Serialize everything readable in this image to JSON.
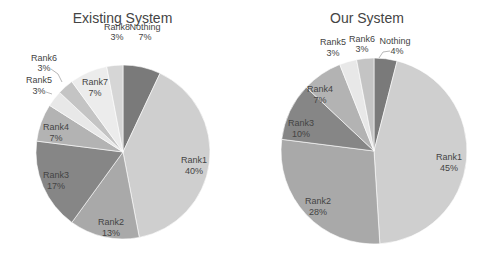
{
  "chart_data": [
    {
      "type": "pie",
      "title": "Existing System",
      "categories": [
        "Nothing",
        "Rank1",
        "Rank2",
        "Rank3",
        "Rank4",
        "Rank5",
        "Rank6",
        "Rank7",
        "Rank8"
      ],
      "values": [
        7,
        40,
        13,
        17,
        7,
        3,
        3,
        7,
        3
      ],
      "labels": [
        "7%",
        "40%",
        "13%",
        "17%",
        "7%",
        "3%",
        "3%",
        "7%",
        "3%"
      ],
      "colors": [
        "#7a7a7a",
        "#cfcfcf",
        "#a9a9a9",
        "#868686",
        "#b3b3b3",
        "#e8e8e8",
        "#c4c4c4",
        "#ececec",
        "#d6d6d6"
      ],
      "start_angle": "12 o'clock, clockwise",
      "legend": "none (labels on slices)"
    },
    {
      "type": "pie",
      "title": "Our System",
      "categories": [
        "Nothing",
        "Rank1",
        "Rank2",
        "Rank3",
        "Rank4",
        "Rank5",
        "Rank6"
      ],
      "values": [
        4,
        45,
        28,
        10,
        7,
        3,
        3
      ],
      "labels": [
        "4%",
        "45%",
        "28%",
        "10%",
        "7%",
        "3%",
        "3%"
      ],
      "colors": [
        "#7a7a7a",
        "#cfcfcf",
        "#a9a9a9",
        "#868686",
        "#b3b3b3",
        "#e8e8e8",
        "#c4c4c4"
      ],
      "start_angle": "12 o'clock, clockwise",
      "legend": "none (labels on slices)"
    }
  ],
  "charts": {
    "left": {
      "title": "Existing System",
      "slices": [
        {
          "name": "Nothing",
          "pct": "7%"
        },
        {
          "name": "Rank1",
          "pct": "40%"
        },
        {
          "name": "Rank2",
          "pct": "13%"
        },
        {
          "name": "Rank3",
          "pct": "17%"
        },
        {
          "name": "Rank4",
          "pct": "7%"
        },
        {
          "name": "Rank5",
          "pct": "3%"
        },
        {
          "name": "Rank6",
          "pct": "3%"
        },
        {
          "name": "Rank7",
          "pct": "7%"
        },
        {
          "name": "Rank8",
          "pct": "3%"
        }
      ]
    },
    "right": {
      "title": "Our System",
      "slices": [
        {
          "name": "Nothing",
          "pct": "4%"
        },
        {
          "name": "Rank1",
          "pct": "45%"
        },
        {
          "name": "Rank2",
          "pct": "28%"
        },
        {
          "name": "Rank3",
          "pct": "10%"
        },
        {
          "name": "Rank4",
          "pct": "7%"
        },
        {
          "name": "Rank5",
          "pct": "3%"
        },
        {
          "name": "Rank6",
          "pct": "3%"
        }
      ]
    }
  }
}
